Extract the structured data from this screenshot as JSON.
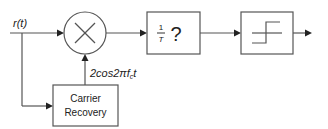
{
  "diagram": {
    "input_signal": {
      "label": "r(t)",
      "base": "r",
      "arg": "(t)"
    },
    "blocks": [
      {
        "id": "multiplier",
        "type": "mixer",
        "symbol": "×"
      },
      {
        "id": "integrator",
        "type": "box",
        "label_num": "1",
        "label_den": "T",
        "label_sym": "?"
      },
      {
        "id": "decision",
        "type": "box",
        "symbol": "threshold-step"
      },
      {
        "id": "carrier_recovery",
        "type": "box",
        "line1": "Carrier",
        "line2": "Recovery"
      }
    ],
    "carrier_label": {
      "prefix": "2cos2πf",
      "sub": "c",
      "suffix": "t"
    },
    "connections": [
      {
        "from": "input",
        "to": "multiplier"
      },
      {
        "from": "input",
        "to": "carrier_recovery"
      },
      {
        "from": "carrier_recovery",
        "to": "multiplier"
      },
      {
        "from": "multiplier",
        "to": "integrator"
      },
      {
        "from": "integrator",
        "to": "decision"
      },
      {
        "from": "decision",
        "to": "output"
      }
    ],
    "colors": {
      "line": "#555555",
      "arrow": "#222222",
      "text": "#222222",
      "background": "#ffffff"
    }
  }
}
